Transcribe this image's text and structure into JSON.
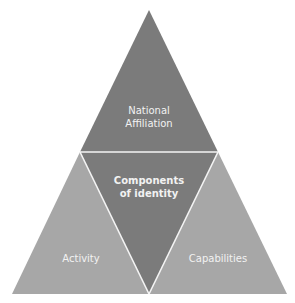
{
  "diagram": {
    "title": "Components of identity",
    "colors": {
      "dark": "#7b7b7b",
      "light": "#a7a7a7",
      "separator": "#f4f4f4",
      "text": "#f2f2f2",
      "background": "#ffffff"
    },
    "center": {
      "line1": "Components",
      "line2": "of identity"
    },
    "top": {
      "line1": "National",
      "line2": "Affiliation"
    },
    "bottom_left": {
      "label": "Activity"
    },
    "bottom_right": {
      "label": "Capabilities"
    }
  }
}
